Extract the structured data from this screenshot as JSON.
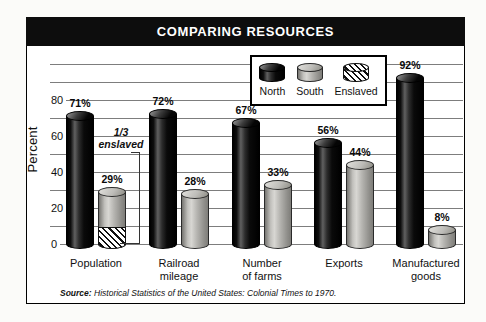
{
  "chart_data": {
    "type": "bar",
    "title": "COMPARING RESOURCES",
    "ylabel": "Percent",
    "value_suffix": "%",
    "ylim": [
      0,
      100
    ],
    "grid_step": 10,
    "grid": true,
    "yticks": [
      0,
      20,
      40,
      60,
      80
    ],
    "categories": [
      "Population",
      "Railroad mileage",
      "Number of farms",
      "Exports",
      "Manufactured goods"
    ],
    "category_label_lines": [
      [
        "Population"
      ],
      [
        "Railroad",
        "mileage"
      ],
      [
        "Number",
        "of farms"
      ],
      [
        "Exports"
      ],
      [
        "Manufactured",
        "goods"
      ]
    ],
    "series": [
      {
        "name": "North",
        "values": [
          71,
          72,
          67,
          56,
          92
        ]
      },
      {
        "name": "South",
        "values": [
          29,
          28,
          33,
          44,
          8
        ]
      }
    ],
    "legend": [
      "North",
      "South",
      "Enslaved"
    ],
    "legend_position": "top-right-inside",
    "hatched_segment": {
      "category": "Population",
      "series": "South",
      "fraction": 0.3333,
      "legend_name": "Enslaved"
    },
    "annotation": {
      "line1": "1/3",
      "line2": "enslaved"
    },
    "source_prefix": "Source:",
    "source_text": "Historical Statistics of the United States: Colonial Times to 1970."
  },
  "colors": {
    "title-bg": "#0d0d0d",
    "title-fg": "#ffffff",
    "gridline": "#7d7d7d",
    "frame": "#000000",
    "north": "#141414",
    "south": "#b3b2ae",
    "hatch-fg": "#101010",
    "hatch-bg": "#ffffff"
  }
}
